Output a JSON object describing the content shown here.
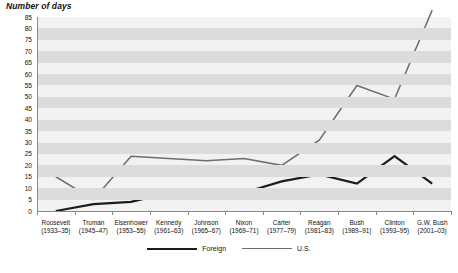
{
  "chart_data": {
    "type": "line",
    "title": "Number of days",
    "xlabel": "",
    "ylabel": "Number of days",
    "ylim": [
      0,
      85
    ],
    "ytick_step": 5,
    "grid": true,
    "legend_position": "bottom",
    "yticks": [
      0,
      5,
      10,
      15,
      20,
      25,
      30,
      35,
      40,
      45,
      50,
      55,
      60,
      65,
      70,
      75,
      80,
      85
    ],
    "categories": [
      "Roosevelt",
      "Truman",
      "Eisenhower",
      "Kennedy",
      "Johnson",
      "Nixon",
      "Carter",
      "Reagan",
      "Bush",
      "Clinton",
      "G.W. Bush"
    ],
    "category_terms": [
      "(1933–35)",
      "(1945–47)",
      "(1953–55)",
      "(1961–63)",
      "(1965–67)",
      "(1969–71)",
      "(1977–79)",
      "(1981–83)",
      "(1989–91)",
      "(1993–95)",
      "(2001–03)"
    ],
    "series": [
      {
        "name": "Foreign",
        "color": "#1c1c1c",
        "values": [
          0,
          3,
          4,
          8,
          8,
          8,
          13,
          16,
          12,
          24,
          12
        ]
      },
      {
        "name": "U.S.",
        "color": "#6e6e6e",
        "values": [
          15,
          5,
          24,
          23,
          22,
          23,
          20,
          31,
          55,
          49,
          88
        ]
      }
    ]
  },
  "legend": {
    "items": [
      {
        "label": "Foreign"
      },
      {
        "label": "U.S."
      }
    ]
  },
  "footnote": {
    "text": ""
  }
}
